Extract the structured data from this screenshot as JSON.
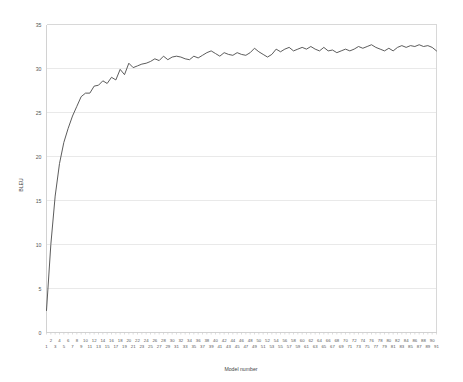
{
  "chart_data": {
    "type": "line",
    "title": "",
    "subtitle": "",
    "xlabel": "Model number",
    "ylabel": "BLEU",
    "xlim": [
      1,
      91
    ],
    "ylim": [
      0,
      35
    ],
    "grid": true,
    "legend": false,
    "legend_position": "none",
    "line_color": "#4a4a4a",
    "grid_color": "#e9e9e9",
    "y_ticks": [
      0,
      5,
      10,
      15,
      20,
      25,
      30,
      35
    ],
    "y_tick_labels": [
      "0",
      "5",
      "10",
      "15",
      "20",
      "25",
      "30",
      "35"
    ],
    "x_ticks": [
      1,
      2,
      3,
      4,
      5,
      6,
      7,
      8,
      9,
      10,
      11,
      12,
      13,
      14,
      15,
      16,
      17,
      18,
      19,
      20,
      21,
      22,
      23,
      24,
      25,
      26,
      27,
      28,
      29,
      30,
      31,
      32,
      33,
      34,
      35,
      36,
      37,
      38,
      39,
      40,
      41,
      42,
      43,
      44,
      45,
      46,
      47,
      48,
      49,
      50,
      51,
      52,
      53,
      54,
      55,
      56,
      57,
      58,
      59,
      60,
      61,
      62,
      63,
      64,
      65,
      66,
      67,
      68,
      69,
      70,
      71,
      72,
      73,
      74,
      75,
      76,
      77,
      78,
      79,
      80,
      81,
      82,
      83,
      84,
      85,
      86,
      87,
      88,
      89,
      90,
      91
    ],
    "x_tick_labels": [
      "1",
      "2",
      "3",
      "4",
      "5",
      "6",
      "7",
      "8",
      "9",
      "10",
      "11",
      "12",
      "13",
      "14",
      "15",
      "16",
      "17",
      "18",
      "19",
      "20",
      "21",
      "22",
      "23",
      "24",
      "25",
      "26",
      "27",
      "28",
      "29",
      "30",
      "31",
      "32",
      "33",
      "34",
      "35",
      "36",
      "37",
      "38",
      "39",
      "40",
      "41",
      "42",
      "43",
      "44",
      "45",
      "46",
      "47",
      "48",
      "49",
      "50",
      "51",
      "52",
      "53",
      "54",
      "55",
      "56",
      "57",
      "58",
      "59",
      "60",
      "61",
      "62",
      "63",
      "64",
      "65",
      "66",
      "67",
      "68",
      "69",
      "70",
      "71",
      "72",
      "73",
      "74",
      "75",
      "76",
      "77",
      "78",
      "79",
      "80",
      "81",
      "82",
      "83",
      "84",
      "85",
      "86",
      "87",
      "88",
      "89",
      "90",
      "91"
    ],
    "x": [
      1,
      2,
      3,
      4,
      5,
      6,
      7,
      8,
      9,
      10,
      11,
      12,
      13,
      14,
      15,
      16,
      17,
      18,
      19,
      20,
      21,
      22,
      23,
      24,
      25,
      26,
      27,
      28,
      29,
      30,
      31,
      32,
      33,
      34,
      35,
      36,
      37,
      38,
      39,
      40,
      41,
      42,
      43,
      44,
      45,
      46,
      47,
      48,
      49,
      50,
      51,
      52,
      53,
      54,
      55,
      56,
      57,
      58,
      59,
      60,
      61,
      62,
      63,
      64,
      65,
      66,
      67,
      68,
      69,
      70,
      71,
      72,
      73,
      74,
      75,
      76,
      77,
      78,
      79,
      80,
      81,
      82,
      83,
      84,
      85,
      86,
      87,
      88,
      89,
      90,
      91
    ],
    "values": [
      2.5,
      10.0,
      15.5,
      19.2,
      21.6,
      23.2,
      24.6,
      25.7,
      26.8,
      27.2,
      27.2,
      28.0,
      28.1,
      28.6,
      28.3,
      29.0,
      28.7,
      29.9,
      29.3,
      30.6,
      30.1,
      30.3,
      30.5,
      30.6,
      30.8,
      31.1,
      30.9,
      31.4,
      31.0,
      31.3,
      31.4,
      31.3,
      31.1,
      31.0,
      31.4,
      31.2,
      31.5,
      31.8,
      32.0,
      31.7,
      31.4,
      31.8,
      31.6,
      31.5,
      31.8,
      31.6,
      31.5,
      31.8,
      32.3,
      31.9,
      31.6,
      31.3,
      31.6,
      32.2,
      31.9,
      32.2,
      32.4,
      32.0,
      32.2,
      32.4,
      32.2,
      32.5,
      32.2,
      32.0,
      32.4,
      32.0,
      32.1,
      31.8,
      32.0,
      32.2,
      32.0,
      32.2,
      32.5,
      32.3,
      32.5,
      32.7,
      32.4,
      32.2,
      32.0,
      32.3,
      32.0,
      32.4,
      32.6,
      32.4,
      32.6,
      32.5,
      32.7,
      32.5,
      32.6,
      32.4,
      32.0
    ]
  }
}
